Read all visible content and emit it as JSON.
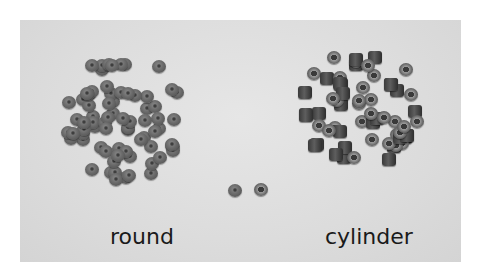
{
  "image": {
    "description": "Photo of two piles of small beads on a light gray surface, with one sample bead of each type in the middle",
    "labels": {
      "left": "round",
      "right": "cylinder"
    },
    "colors": {
      "background": "#ffffff",
      "surface": "#dcdcdc",
      "bead_round": "#6a6a6a",
      "bead_cylinder": "#444444",
      "label_text": "#1a1a1a"
    }
  }
}
